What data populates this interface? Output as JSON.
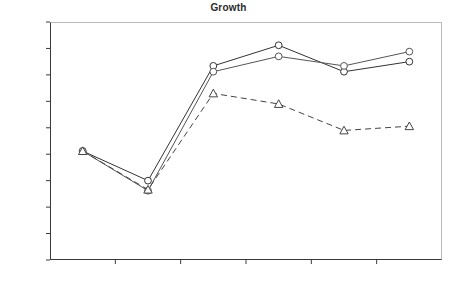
{
  "chart_data": {
    "type": "line",
    "title": "Growth",
    "xlabel": "",
    "ylabel": "",
    "categories": [
      "2001",
      "2002",
      "2003",
      "2004",
      "2005",
      "2006"
    ],
    "ylim": [
      0.0,
      4.5
    ],
    "yticks": [
      "0.00",
      "0.50",
      "1.00",
      "1.50",
      "2.00",
      "2.50",
      "3.00",
      "3.50",
      "4.00",
      "4.50"
    ],
    "ytick_values": [
      0.0,
      0.5,
      1.0,
      1.5,
      2.0,
      2.5,
      3.0,
      3.5,
      4.0,
      4.5
    ],
    "grid": false,
    "legend": "none",
    "series": [
      {
        "name": "series-1",
        "line_style": "solid",
        "marker": "circle-open",
        "color": "#333333",
        "values": [
          2.06,
          1.5,
          3.67,
          4.06,
          3.56,
          3.75
        ]
      },
      {
        "name": "series-2",
        "line_style": "solid",
        "marker": "circle-open",
        "color": "#555555",
        "values": [
          2.06,
          1.31,
          3.56,
          3.85,
          3.67,
          3.94
        ]
      },
      {
        "name": "series-3",
        "line_style": "dashed",
        "marker": "triangle-open",
        "color": "#444444",
        "values": [
          2.06,
          1.33,
          3.15,
          2.95,
          2.45,
          2.53
        ]
      }
    ]
  },
  "axes": {
    "axis_line_color": "#3a3a3a",
    "frame_color": "#b9b9b9"
  }
}
